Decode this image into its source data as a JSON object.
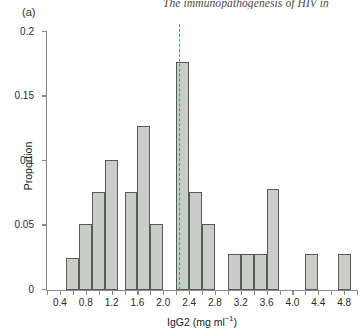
{
  "running_head": "The immunopathogenesis of HIV in",
  "panel_label": "(a)",
  "chart_data": {
    "type": "bar",
    "title": "",
    "subtitle": "",
    "xlabel_text": "IgG2 (mg ml",
    "xlabel_sup": "−1",
    "xlabel_tail": ")",
    "xlabel": "IgG2 (mg ml⁻¹)",
    "ylabel": "Proportion",
    "xlim": [
      0.2,
      5.0
    ],
    "ylim": [
      0,
      0.2
    ],
    "ytick_labels": [
      "0",
      "0.05",
      "0.1",
      "0.15",
      "0.2"
    ],
    "ytick_values": [
      0,
      0.05,
      0.1,
      0.15,
      0.2
    ],
    "xtick_labels": [
      "0.4",
      "0.8",
      "1.2",
      "1.6",
      "2.0",
      "2.4",
      "2.8",
      "3.2",
      "3.6",
      "4.0",
      "4.4",
      "4.8"
    ],
    "xtick_values": [
      0.4,
      0.8,
      1.2,
      1.6,
      2.0,
      2.4,
      2.8,
      3.2,
      3.6,
      4.0,
      4.4,
      4.8
    ],
    "xminor_values": [
      0.2,
      0.4,
      0.6,
      0.8,
      1.0,
      1.2,
      1.4,
      1.6,
      1.8,
      2.0,
      2.2,
      2.4,
      2.6,
      2.8,
      3.0,
      3.2,
      3.4,
      3.6,
      3.8,
      4.0,
      4.2,
      4.4,
      4.6,
      4.8,
      5.0
    ],
    "grid": false,
    "legend": false,
    "bin_width": 0.2,
    "bar_fill": "#c9ccc7",
    "bar_edge": "#585c58",
    "bins": [
      {
        "x0": 0.5,
        "x1": 0.7,
        "value": 0.025
      },
      {
        "x0": 0.7,
        "x1": 0.9,
        "value": 0.051
      },
      {
        "x0": 0.9,
        "x1": 1.1,
        "value": 0.076
      },
      {
        "x0": 1.1,
        "x1": 1.3,
        "value": 0.101
      },
      {
        "x0": 1.4,
        "x1": 1.6,
        "value": 0.076
      },
      {
        "x0": 1.6,
        "x1": 1.8,
        "value": 0.127
      },
      {
        "x0": 1.8,
        "x1": 2.0,
        "value": 0.051
      },
      {
        "x0": 2.2,
        "x1": 2.4,
        "value": 0.177
      },
      {
        "x0": 2.4,
        "x1": 2.6,
        "value": 0.076
      },
      {
        "x0": 2.6,
        "x1": 2.8,
        "value": 0.051
      },
      {
        "x0": 3.0,
        "x1": 3.2,
        "value": 0.028
      },
      {
        "x0": 3.2,
        "x1": 3.4,
        "value": 0.028
      },
      {
        "x0": 3.4,
        "x1": 3.6,
        "value": 0.028
      },
      {
        "x0": 3.6,
        "x1": 3.8,
        "value": 0.078
      },
      {
        "x0": 4.2,
        "x1": 4.4,
        "value": 0.028
      },
      {
        "x0": 4.7,
        "x1": 4.9,
        "value": 0.028
      }
    ],
    "reference_line": {
      "x": 2.25,
      "color": "#d4604a",
      "style": "dashed"
    }
  }
}
